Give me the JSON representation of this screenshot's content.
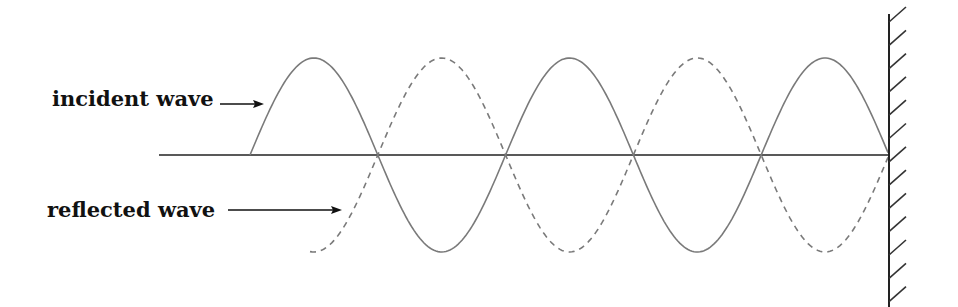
{
  "labels": {
    "incident": "incident wave",
    "reflected": "reflected wave"
  },
  "colors": {
    "wave": "#7a7a7a",
    "axis": "#222222",
    "wall": "#222222",
    "text": "#111111"
  },
  "geometry": {
    "axis": {
      "x1": 159,
      "x2": 889,
      "y": 155
    },
    "amplitude": 97,
    "half_wavelength": 128,
    "wall": {
      "x": 889,
      "y_top": 14,
      "y_bottom": 307,
      "hatch_dx": 17,
      "hatch_dy": 15,
      "hatch_start_y": 22,
      "hatch_spacing": 23.3,
      "hatch_count": 13
    },
    "incident_wave": {
      "x_start": 250,
      "x_end": 889,
      "style": "solid",
      "starts_at": "axis-rising"
    },
    "reflected_wave": {
      "x_start": 310,
      "x_end": 889,
      "style": "dashed",
      "starts_at": "near-trough"
    },
    "incident_label": {
      "x": 52,
      "y": 106,
      "arrow": {
        "x1": 220,
        "x2": 263,
        "y": 104
      }
    },
    "reflected_label": {
      "x": 47,
      "y": 217,
      "arrow": {
        "x1": 228,
        "x2": 341,
        "y": 210
      }
    }
  }
}
